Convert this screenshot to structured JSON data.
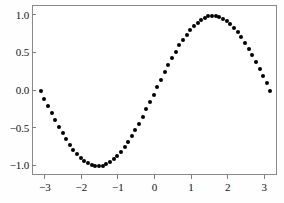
{
  "chart_data": {
    "type": "scatter",
    "title": "",
    "subtitle": "",
    "xlabel": "",
    "ylabel": "",
    "xlim": [
      -3.35,
      3.35
    ],
    "ylim": [
      -1.13,
      1.13
    ],
    "grid": false,
    "legend": null,
    "marker": {
      "shape": "circle",
      "color": "#000000",
      "size_px": 4
    },
    "frame_color": "#8a8a8a",
    "background_color": "#ffffff",
    "xticks": [
      -3,
      -2,
      -1,
      0,
      1,
      2,
      3
    ],
    "xticklabels": [
      "−3",
      "−2",
      "−1",
      "0",
      "1",
      "2",
      "3"
    ],
    "yticks": [
      -1.0,
      -0.5,
      0.0,
      0.5,
      1.0
    ],
    "yticklabels": [
      "−1.0",
      "−0.5",
      "0.0",
      "0.5",
      "1.0"
    ],
    "series": [
      {
        "name": "sin(x)",
        "x": [
          -3.14159,
          -3.04181,
          -2.94203,
          -2.84225,
          -2.74247,
          -2.64269,
          -2.54291,
          -2.44313,
          -2.34335,
          -2.24357,
          -2.14379,
          -2.04401,
          -1.94423,
          -1.84445,
          -1.74467,
          -1.64489,
          -1.54511,
          -1.44533,
          -1.34555,
          -1.24577,
          -1.14599,
          -1.04621,
          -0.94643,
          -0.84665,
          -0.74687,
          -0.64709,
          -0.54731,
          -0.44753,
          -0.34775,
          -0.24797,
          -0.14819,
          -0.04841,
          0.05137,
          0.15115,
          0.25093,
          0.35071,
          0.45049,
          0.55027,
          0.65005,
          0.74983,
          0.84961,
          0.94939,
          1.04917,
          1.14895,
          1.24873,
          1.34851,
          1.44829,
          1.54807,
          1.64785,
          1.74763,
          1.84741,
          1.94719,
          2.04697,
          2.14675,
          2.24653,
          2.34631,
          2.44609,
          2.54587,
          2.64565,
          2.74543,
          2.84521,
          2.94499,
          3.04477,
          3.14159
        ],
        "y": [
          0.0,
          -0.0998,
          -0.1987,
          -0.2955,
          -0.3894,
          -0.4791,
          -0.5639,
          -0.6428,
          -0.7151,
          -0.78,
          -0.8368,
          -0.8851,
          -0.9243,
          -0.954,
          -0.9841,
          -0.9975,
          -0.9995,
          -0.9919,
          -0.9748,
          -0.9463,
          -0.9086,
          -0.8632,
          -0.8104,
          -0.7489,
          -0.6799,
          -0.6019,
          -0.5206,
          -0.4328,
          -0.3409,
          -0.2454,
          -0.1477,
          -0.0484,
          0.0513,
          0.1506,
          0.2483,
          0.3436,
          0.4353,
          0.5229,
          0.605,
          0.6812,
          0.7503,
          0.8119,
          0.8648,
          0.9107,
          0.9478,
          0.9751,
          0.9921,
          0.9995,
          0.9972,
          0.9847,
          0.9608,
          0.9302,
          0.8884,
          0.8378,
          0.7789,
          0.7124,
          0.639,
          0.5596,
          0.4749,
          0.3859,
          0.2935,
          0.1986,
          0.1022,
          0.0
        ]
      }
    ]
  }
}
